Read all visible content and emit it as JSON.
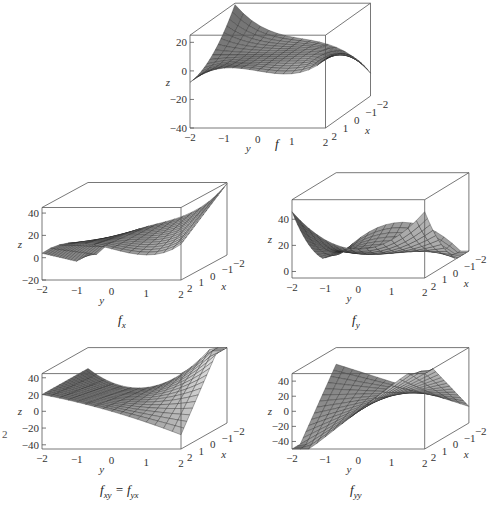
{
  "figure": {
    "left_margin_fragment": "2",
    "panels": [
      {
        "id": "f",
        "caption": "f",
        "caption_sub": "",
        "box": {
          "x": 168,
          "y": 0,
          "w": 225,
          "h": 160
        },
        "caption_pos": {
          "x": 275,
          "y": 136
        }
      },
      {
        "id": "fx",
        "caption": "f",
        "caption_sub": "x",
        "box": {
          "x": 20,
          "y": 180,
          "w": 230,
          "h": 125
        },
        "caption_pos": {
          "x": 118,
          "y": 312
        }
      },
      {
        "id": "fy",
        "caption": "f",
        "caption_sub": "y",
        "box": {
          "x": 270,
          "y": 170,
          "w": 221,
          "h": 135
        },
        "caption_pos": {
          "x": 352,
          "y": 312
        }
      },
      {
        "id": "fxy",
        "caption": "f",
        "caption_sub": "xy",
        "caption_extra": " = f",
        "caption_sub2": "yx",
        "box": {
          "x": 20,
          "y": 345,
          "w": 230,
          "h": 130
        },
        "caption_pos": {
          "x": 100,
          "y": 482
        }
      },
      {
        "id": "fyy",
        "caption": "f",
        "caption_sub": "yy",
        "box": {
          "x": 270,
          "y": 345,
          "w": 221,
          "h": 130
        },
        "caption_pos": {
          "x": 350,
          "y": 482
        }
      }
    ]
  },
  "chart_data": [
    {
      "type": "surface3d",
      "title": "f",
      "xlabel": "x",
      "ylabel": "y",
      "zlabel": "z",
      "x_ticks": [
        "-2",
        "-1",
        "0",
        "1",
        "2"
      ],
      "y_ticks": [
        "-2",
        "-1",
        "0",
        "1",
        "2"
      ],
      "z_ticks": [
        "20",
        "0",
        "-20",
        "-40"
      ],
      "zlim": [
        -40,
        25
      ],
      "grid": false
    },
    {
      "type": "surface3d",
      "title": "f_x",
      "xlabel": "x",
      "ylabel": "y",
      "zlabel": "z",
      "x_ticks": [
        "-2",
        "-1",
        "0",
        "1",
        "2"
      ],
      "y_ticks": [
        "-2",
        "-1",
        "0",
        "1",
        "2"
      ],
      "z_ticks": [
        "40",
        "20",
        "0",
        "-20"
      ],
      "zlim": [
        -20,
        45
      ],
      "grid": false
    },
    {
      "type": "surface3d",
      "title": "f_y",
      "xlabel": "x",
      "ylabel": "y",
      "zlabel": "z",
      "x_ticks": [
        "-2",
        "-1",
        "0",
        "1",
        "2"
      ],
      "y_ticks": [
        "-2",
        "-1",
        "0",
        "1",
        "2"
      ],
      "z_ticks": [
        "40",
        "20",
        "0"
      ],
      "zlim": [
        -5,
        55
      ],
      "grid": false
    },
    {
      "type": "surface3d",
      "title": "f_xy = f_yx",
      "xlabel": "x",
      "ylabel": "y",
      "zlabel": "z",
      "x_ticks": [
        "-2",
        "-1",
        "0",
        "1",
        "2"
      ],
      "y_ticks": [
        "-2",
        "-1",
        "0",
        "1",
        "2"
      ],
      "z_ticks": [
        "40",
        "20",
        "0",
        "-20",
        "-40"
      ],
      "zlim": [
        -45,
        45
      ],
      "grid": false
    },
    {
      "type": "surface3d",
      "title": "f_yy",
      "xlabel": "x",
      "ylabel": "y",
      "zlabel": "z",
      "x_ticks": [
        "-2",
        "-1",
        "0",
        "1",
        "2"
      ],
      "y_ticks": [
        "-2",
        "-1",
        "0",
        "1",
        "2"
      ],
      "z_ticks": [
        "40",
        "20",
        "0",
        "-20",
        "-40"
      ],
      "zlim": [
        -50,
        50
      ],
      "grid": false
    }
  ]
}
